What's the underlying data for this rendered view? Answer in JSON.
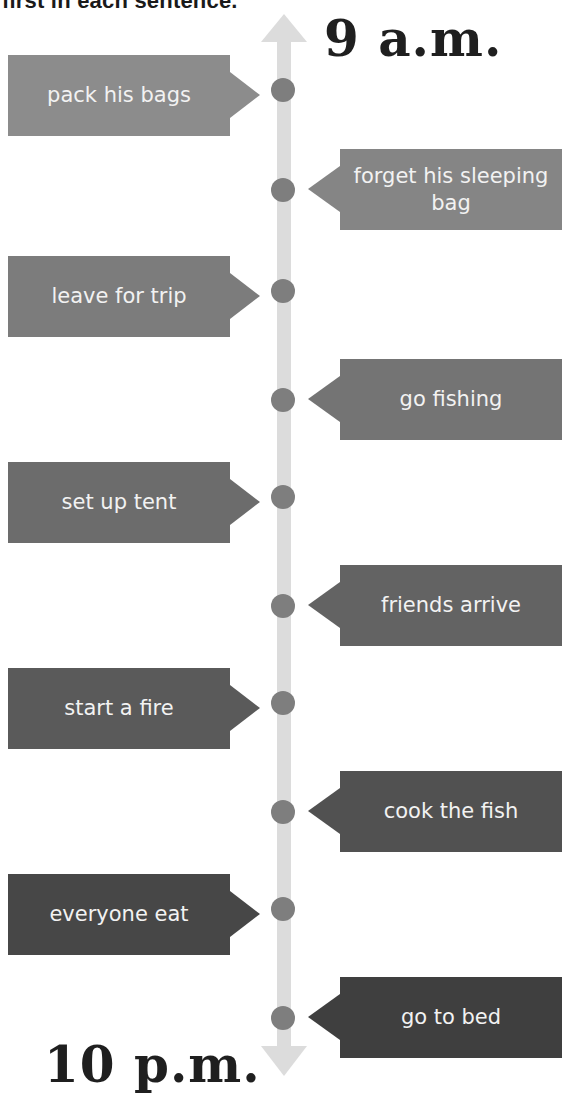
{
  "instruction": "first in each sentence.",
  "time_start": "9 a.m.",
  "time_end": "10 p.m.",
  "events": [
    {
      "label": "pack his bags",
      "side": "left",
      "color": "#8c8c8c"
    },
    {
      "label": "forget his sleeping bag",
      "side": "right",
      "color": "#858585"
    },
    {
      "label": "leave for trip",
      "side": "left",
      "color": "#7c7c7c"
    },
    {
      "label": "go fishing",
      "side": "right",
      "color": "#747474"
    },
    {
      "label": "set up tent",
      "side": "left",
      "color": "#6c6c6c"
    },
    {
      "label": "friends arrive",
      "side": "right",
      "color": "#636363"
    },
    {
      "label": "start a fire",
      "side": "left",
      "color": "#5a5a5a"
    },
    {
      "label": "cook the fish",
      "side": "right",
      "color": "#515151"
    },
    {
      "label": "everyone eat",
      "side": "left",
      "color": "#474747"
    },
    {
      "label": "go to bed",
      "side": "right",
      "color": "#3f3f3f"
    }
  ],
  "colors": {
    "spine": "#dcdcdc",
    "dot": "#7e7e7e",
    "callout_text": "#f2f2f2",
    "time_label": "#1f1f1f"
  }
}
